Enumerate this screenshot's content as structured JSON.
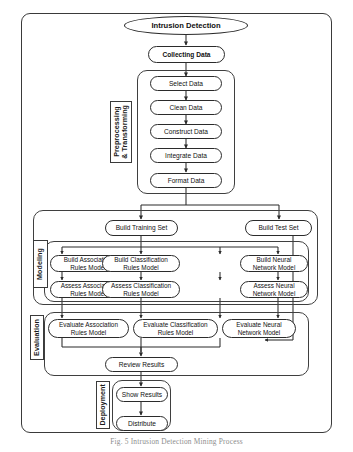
{
  "figure": {
    "caption": "Fig. 5 Intrusion Detection Mining Process"
  },
  "start_node": {
    "label": "Intrusion Detection",
    "shape": "ellipse"
  },
  "collect_node": {
    "label": "Collecting Data",
    "shape": "stadium"
  },
  "phases": [
    {
      "id": "preprocessing",
      "label": "Preprocessing\n& Transforming",
      "nodes": [
        {
          "label": "Select Data"
        },
        {
          "label": "Clean Data"
        },
        {
          "label": "Construct Data"
        },
        {
          "label": "Integrate Data"
        },
        {
          "label": "Format Data"
        }
      ]
    },
    {
      "id": "modeling",
      "label": "Modeling",
      "split_nodes": [
        {
          "label": "Build Training Set"
        },
        {
          "label": "Build Test Set"
        }
      ],
      "build_nodes": [
        {
          "line1": "Build Association",
          "line2": "Rules Model"
        },
        {
          "line1": "Build Classification",
          "line2": "Rules Model"
        },
        {
          "line1": "Build Neural",
          "line2": "Network Model"
        }
      ],
      "assess_nodes": [
        {
          "line1": "Assess Association",
          "line2": "Rules Model"
        },
        {
          "line1": "Assess Classification",
          "line2": "Rules Model"
        },
        {
          "line1": "Assess Neural",
          "line2": "Network Model"
        }
      ]
    },
    {
      "id": "evaluation",
      "label": "Evaluation",
      "evaluate_nodes": [
        {
          "line1": "Evaluate Association",
          "line2": "Rules Model"
        },
        {
          "line1": "Evaluate Classification",
          "line2": "Rules Model"
        },
        {
          "line1": "Evaluate Neural",
          "line2": "Network Model"
        }
      ],
      "review_node": {
        "label": "Review Results"
      }
    },
    {
      "id": "deployment",
      "label": "Deployment",
      "nodes": [
        {
          "label": "Show Results"
        },
        {
          "label": "Distribute"
        }
      ]
    }
  ],
  "colors": {
    "stroke": "#2b2b2b",
    "frame": "#3a3a3a",
    "background": "#ffffff",
    "text": "#111111",
    "caption": "#8d8d8d"
  }
}
